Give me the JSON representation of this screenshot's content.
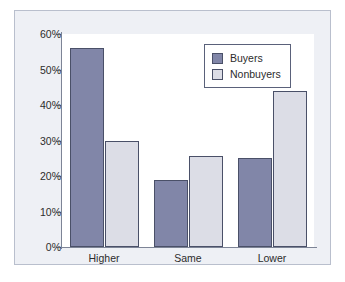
{
  "chart_data": {
    "type": "bar",
    "title": "",
    "subtitle": "",
    "xlabel": "",
    "ylabel": "",
    "categories": [
      "Higher",
      "Same",
      "Lower"
    ],
    "series": [
      {
        "name": "Buyers",
        "color": "#8186a8",
        "values": [
          56,
          19,
          25
        ]
      },
      {
        "name": "Nonbuyers",
        "color": "#dcdde6",
        "values": [
          30,
          25.5,
          44
        ]
      }
    ],
    "ylim": [
      0,
      60
    ],
    "ytick_values": [
      0,
      10,
      20,
      30,
      40,
      50,
      60
    ],
    "ytick_labels": [
      "0%",
      "10%",
      "20%",
      "30%",
      "40%",
      "50%",
      "60%"
    ],
    "grid": false,
    "legend_position": "top-right",
    "value_format": "percent",
    "annotations": []
  },
  "legend": {
    "entries": [
      {
        "label": "Buyers"
      },
      {
        "label": "Nonbuyers"
      }
    ]
  },
  "colors": {
    "buyers": "#8186a8",
    "nonbuyers": "#dcdde6",
    "bar_outline": "#4a5068",
    "axis": "#7d8496",
    "figure_background": "#eef0f5",
    "figure_border": "#b9bfcd",
    "plot_background": "#ffffff",
    "text": "#2c2c2c"
  }
}
